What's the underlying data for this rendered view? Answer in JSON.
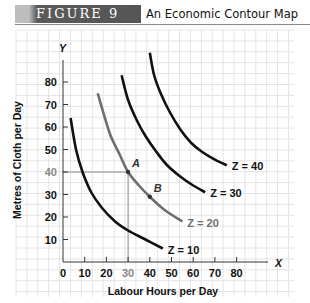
{
  "header": {
    "figure_label": "FIGURE 9",
    "title": "An Economic Contour Map"
  },
  "chart_data": {
    "type": "line",
    "title": "An Economic Contour Map",
    "xlabel": "Labour Hours per Day",
    "ylabel": "Metres of Cloth per Day",
    "x_axis_symbol": "X",
    "y_axis_symbol": "Y",
    "xlim": [
      0,
      90
    ],
    "ylim": [
      0,
      90
    ],
    "xticks": [
      0,
      10,
      20,
      30,
      40,
      50,
      60,
      70,
      80
    ],
    "yticks": [
      10,
      20,
      30,
      40,
      50,
      60,
      70,
      80
    ],
    "highlighted_ticks": {
      "x": [
        30
      ],
      "y": [
        40
      ]
    },
    "grid": true,
    "series": [
      {
        "name": "Z = 10",
        "color": "#111111",
        "points": [
          [
            3.5,
            64
          ],
          [
            6,
            50
          ],
          [
            9,
            40
          ],
          [
            13,
            31
          ],
          [
            18,
            24
          ],
          [
            24,
            18
          ],
          [
            30,
            14
          ],
          [
            38,
            10
          ],
          [
            46,
            6
          ]
        ]
      },
      {
        "name": "Z = 20",
        "color": "#6e6e6e",
        "points": [
          [
            16,
            75
          ],
          [
            19,
            65
          ],
          [
            22,
            56
          ],
          [
            26,
            48
          ],
          [
            30,
            40
          ],
          [
            35,
            34
          ],
          [
            40,
            29
          ],
          [
            47,
            23
          ],
          [
            55,
            18
          ]
        ]
      },
      {
        "name": "Z = 30",
        "color": "#111111",
        "points": [
          [
            27,
            83
          ],
          [
            30,
            72
          ],
          [
            34,
            63
          ],
          [
            38,
            56
          ],
          [
            43,
            49
          ],
          [
            48,
            43
          ],
          [
            54,
            38
          ],
          [
            60,
            34
          ],
          [
            65.5,
            31
          ]
        ]
      },
      {
        "name": "Z = 40",
        "color": "#111111",
        "points": [
          [
            40,
            93
          ],
          [
            42,
            83
          ],
          [
            45,
            75
          ],
          [
            49,
            67
          ],
          [
            54,
            59
          ],
          [
            59,
            53
          ],
          [
            64,
            49
          ],
          [
            70,
            45.5
          ],
          [
            75.5,
            43
          ]
        ]
      }
    ],
    "points": [
      {
        "label": "A",
        "x": 30,
        "y": 40,
        "guides": true
      },
      {
        "label": "B",
        "x": 40,
        "y": 29,
        "guides": false
      }
    ]
  }
}
